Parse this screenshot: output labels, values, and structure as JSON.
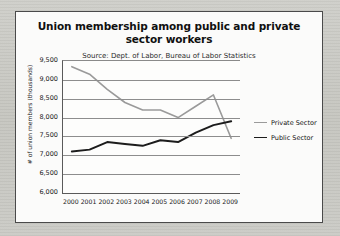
{
  "chart_data": {
    "type": "line",
    "title": "Union membership among public and private sector workers",
    "subtitle": "Source: Dept. of Labor, Bureau of Labor Statistics",
    "xlabel": "",
    "ylabel": "# of union members (thousands)",
    "categories": [
      "2000",
      "2001",
      "2002",
      "2003",
      "2004",
      "2005",
      "2006",
      "2007",
      "2008",
      "2009"
    ],
    "ylim": [
      6000,
      9500
    ],
    "yticks": [
      "6,000",
      "6,500",
      "7,000",
      "7,500",
      "8,000",
      "8,500",
      "9,000",
      "9,500"
    ],
    "ytick_values": [
      6000,
      6500,
      7000,
      7500,
      8000,
      8500,
      9000,
      9500
    ],
    "grid": true,
    "legend_position": "right",
    "series": [
      {
        "name": "Private Sector",
        "color": "#9a9a9a",
        "values": [
          9350,
          9150,
          8750,
          8400,
          8200,
          8200,
          8000,
          8300,
          8600,
          7450
        ]
      },
      {
        "name": "Public Sector",
        "color": "#1c1c1c",
        "values": [
          7100,
          7150,
          7350,
          7300,
          7250,
          7400,
          7350,
          7600,
          7800,
          7900
        ]
      }
    ]
  },
  "legend": {
    "items": [
      {
        "label": "Private Sector",
        "color": "#9a9a9a"
      },
      {
        "label": "Public Sector",
        "color": "#1c1c1c"
      }
    ]
  }
}
